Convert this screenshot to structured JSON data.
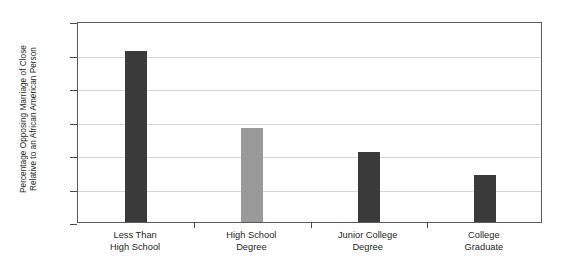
{
  "chart_data": {
    "type": "bar",
    "title": "",
    "subtitle": "",
    "xlabel": "",
    "ylabel": "Percentage Opposing Marriage of Close Relative to an African American Person",
    "ylabel_lines": [
      "Percentage Opposing Marriage of Close",
      "Relative to an African American Person"
    ],
    "categories": [
      "Less Than High School",
      "High School Degree",
      "Junior College Degree",
      "College Graduate"
    ],
    "category_lines": [
      [
        "Less Than",
        "High School"
      ],
      [
        "High School",
        "Degree"
      ],
      [
        "Junior College",
        "Degree"
      ],
      [
        "College",
        "Graduate"
      ]
    ],
    "values": [
      51,
      28,
      21,
      14
    ],
    "bar_colors": [
      "#3a3a3a",
      "#9a9a9a",
      "#3a3a3a",
      "#3a3a3a"
    ],
    "ylim": [
      0,
      60
    ],
    "yticks": [
      0,
      10,
      20,
      30,
      40,
      50,
      60
    ],
    "ytick_labels": [
      "0",
      "10",
      "20",
      "30",
      "40",
      "50",
      "60"
    ],
    "grid": true,
    "grid_color": "#d5d5d5",
    "legend": null,
    "legend_position": "none",
    "frame_color": "#5a5a5a",
    "background_color": "#ffffff"
  }
}
